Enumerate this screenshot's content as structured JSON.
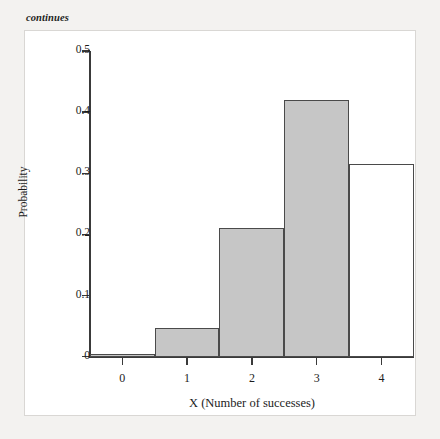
{
  "page": {
    "caption_note": "continues"
  },
  "chart_data": {
    "type": "bar",
    "title": "",
    "subtitle": "",
    "xlabel": "X (Number of successes)",
    "ylabel": "Probability",
    "categories": [
      "0",
      "1",
      "2",
      "3",
      "4"
    ],
    "values": [
      0.004,
      0.047,
      0.21,
      0.42,
      0.316
    ],
    "bar_styles": [
      "filled",
      "filled",
      "filled",
      "filled",
      "unfilled"
    ],
    "fill_color": "#c6c6c6",
    "unfilled_color": "#ffffff",
    "border_color": "#4a4a4a",
    "xlim": [
      -0.5,
      4.5
    ],
    "ylim": [
      0,
      0.5
    ],
    "ytick_values": [
      0,
      0.1,
      0.2,
      0.3,
      0.4,
      0.5
    ],
    "ytick_labels": [
      "0",
      "0.1",
      "0.2",
      "0.3",
      "0.4",
      "0.5"
    ],
    "xtick_values": [
      0,
      1,
      2,
      3,
      4
    ],
    "xtick_labels": [
      "0",
      "1",
      "2",
      "3",
      "4"
    ],
    "grid": false,
    "legend": null,
    "annotations": []
  }
}
